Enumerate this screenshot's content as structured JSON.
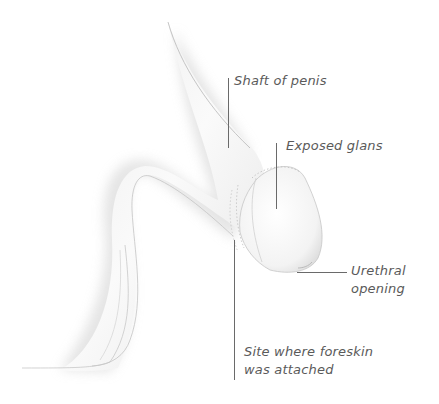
{
  "diagram": {
    "type": "anatomical illustration",
    "colors": {
      "background": "#ffffff",
      "label_text": "#5a5a5a",
      "leader_line": "#6a6a6a",
      "outline": "#b8b8b8",
      "shade": "#d9d9d9"
    },
    "labels": [
      {
        "id": "shaft",
        "text": "Shaft of penis"
      },
      {
        "id": "glans",
        "text": "Exposed glans"
      },
      {
        "id": "urethral",
        "lines": [
          "Urethral",
          "opening"
        ]
      },
      {
        "id": "foreskin-site",
        "lines": [
          "Site where foreskin",
          "was attached"
        ]
      }
    ]
  }
}
